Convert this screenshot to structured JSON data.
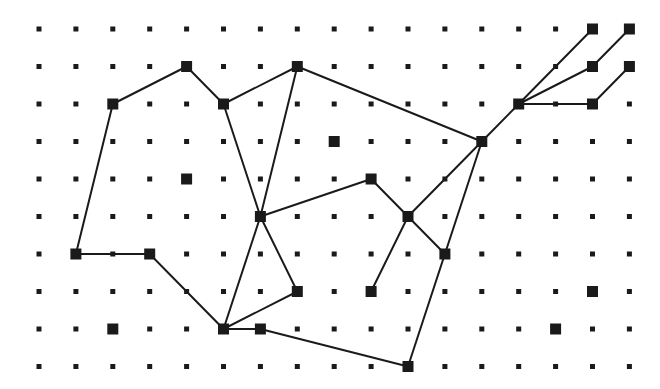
{
  "diagram": {
    "type": "grid-graph",
    "grid": {
      "cols": 17,
      "rows": 10,
      "origin_x": 39,
      "origin_y": 29,
      "step_x": 36.9,
      "step_y": 37.5,
      "dot_size": 5,
      "dot_color": "#1a1a1a"
    },
    "node_style": {
      "size": 11,
      "color": "#1a1a1a"
    },
    "edge_style": {
      "width": 2,
      "color": "#1a1a1a"
    },
    "nodes": [
      {
        "id": "n15_0",
        "col": 15,
        "row": 0
      },
      {
        "id": "n16_0",
        "col": 16,
        "row": 0
      },
      {
        "id": "n4_1",
        "col": 4,
        "row": 1
      },
      {
        "id": "n7_1",
        "col": 7,
        "row": 1
      },
      {
        "id": "n15_1",
        "col": 15,
        "row": 1
      },
      {
        "id": "n16_1",
        "col": 16,
        "row": 1
      },
      {
        "id": "n2_2",
        "col": 2,
        "row": 2
      },
      {
        "id": "n5_2",
        "col": 5,
        "row": 2
      },
      {
        "id": "n13_2",
        "col": 13,
        "row": 2
      },
      {
        "id": "n15_2",
        "col": 15,
        "row": 2
      },
      {
        "id": "n8_3",
        "col": 8,
        "row": 3
      },
      {
        "id": "n12_3",
        "col": 12,
        "row": 3
      },
      {
        "id": "n4_4",
        "col": 4,
        "row": 4
      },
      {
        "id": "n9_4",
        "col": 9,
        "row": 4
      },
      {
        "id": "n6_5",
        "col": 6,
        "row": 5
      },
      {
        "id": "n10_5",
        "col": 10,
        "row": 5
      },
      {
        "id": "n1_6",
        "col": 1,
        "row": 6
      },
      {
        "id": "n3_6",
        "col": 3,
        "row": 6
      },
      {
        "id": "n11_6",
        "col": 11,
        "row": 6
      },
      {
        "id": "n7_7",
        "col": 7,
        "row": 7
      },
      {
        "id": "n9_7",
        "col": 9,
        "row": 7
      },
      {
        "id": "n15_7",
        "col": 15,
        "row": 7
      },
      {
        "id": "n2_8",
        "col": 2,
        "row": 8
      },
      {
        "id": "n5_8",
        "col": 5,
        "row": 8
      },
      {
        "id": "n6_8",
        "col": 6,
        "row": 8
      },
      {
        "id": "n14_8",
        "col": 14,
        "row": 8
      },
      {
        "id": "n10_9",
        "col": 10,
        "row": 9
      }
    ],
    "edges": [
      [
        "n2_2",
        "n4_1"
      ],
      [
        "n4_1",
        "n5_2"
      ],
      [
        "n5_2",
        "n7_1"
      ],
      [
        "n7_1",
        "n12_3"
      ],
      [
        "n2_2",
        "n1_6"
      ],
      [
        "n1_6",
        "n3_6"
      ],
      [
        "n3_6",
        "n5_8"
      ],
      [
        "n5_2",
        "n6_5"
      ],
      [
        "n7_1",
        "n6_5"
      ],
      [
        "n6_5",
        "n9_4"
      ],
      [
        "n6_5",
        "n5_8"
      ],
      [
        "n6_5",
        "n7_7"
      ],
      [
        "n5_8",
        "n7_7"
      ],
      [
        "n5_8",
        "n6_8"
      ],
      [
        "n6_8",
        "n10_9"
      ],
      [
        "n9_4",
        "n10_5"
      ],
      [
        "n10_5",
        "n12_3"
      ],
      [
        "n10_5",
        "n11_6"
      ],
      [
        "n10_5",
        "n9_7"
      ],
      [
        "n12_3",
        "n11_6"
      ],
      [
        "n11_6",
        "n10_9"
      ],
      [
        "n12_3",
        "n13_2"
      ],
      [
        "n13_2",
        "n15_0"
      ],
      [
        "n13_2",
        "n15_1"
      ],
      [
        "n13_2",
        "n15_2"
      ],
      [
        "n15_1",
        "n16_0"
      ],
      [
        "n15_2",
        "n16_1"
      ]
    ]
  }
}
